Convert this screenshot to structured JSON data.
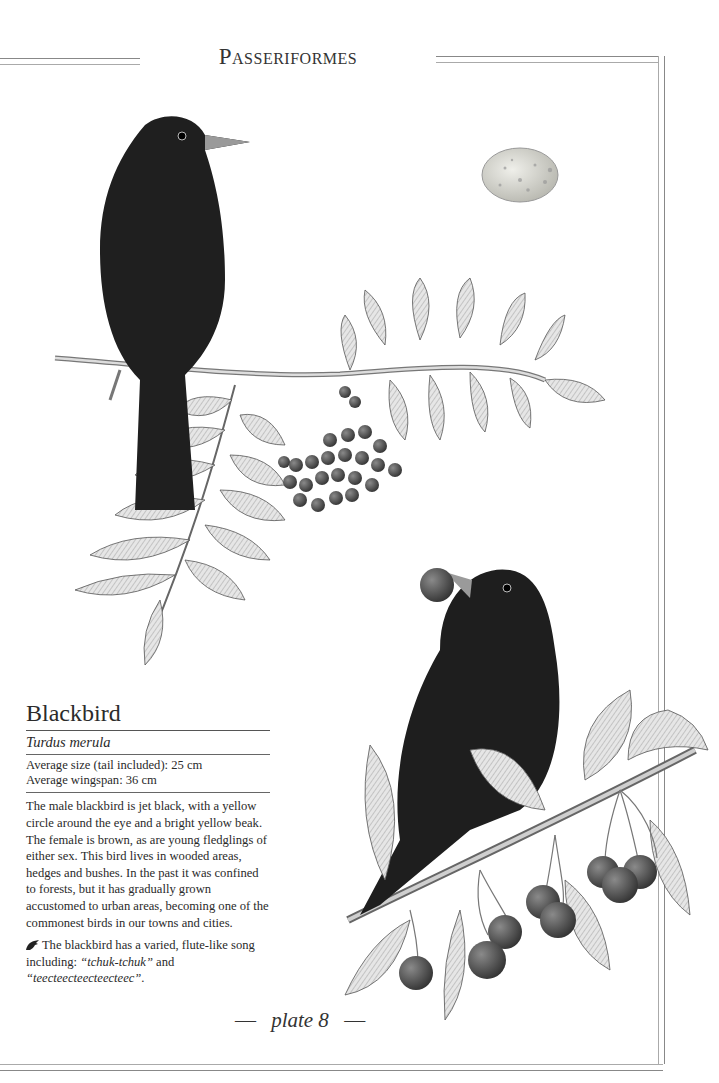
{
  "header": {
    "order_title": "Passeriformes"
  },
  "species": {
    "common_name": "Blackbird",
    "scientific_name": "Turdus merula",
    "measurements": [
      "Average size (tail included): 25 cm",
      "Average wingspan: 36 cm"
    ],
    "description": "The male blackbird is jet black, with a yellow circle around the eye and a bright yellow beak. The female is brown, as are young fledglings of either sex. This bird lives in wooded areas, hedges and bushes. In the past it was confined to forests, but it has gradually grown accustomed to urban areas, becoming one of the commonest birds in our towns and cities.",
    "song": {
      "intro": "The blackbird has a varied, flute-like song including: ",
      "call_1": "“tchuk-tchuk”",
      "joiner": " and ",
      "call_2": "“teecteecteecteecteec”",
      "end": ".",
      "icon": "bird-song-icon"
    }
  },
  "illustrations": {
    "top": "blackbird perched on rowan branch with berries",
    "egg": "speckled blackbird egg",
    "bottom": "blackbird with cherry in beak on cherry branch"
  },
  "footer": {
    "dash": "—",
    "plate_label": "plate 8"
  },
  "colors": {
    "ink": "#2a2a2a",
    "frame": "#888888",
    "egg": "#cfcfc8"
  }
}
